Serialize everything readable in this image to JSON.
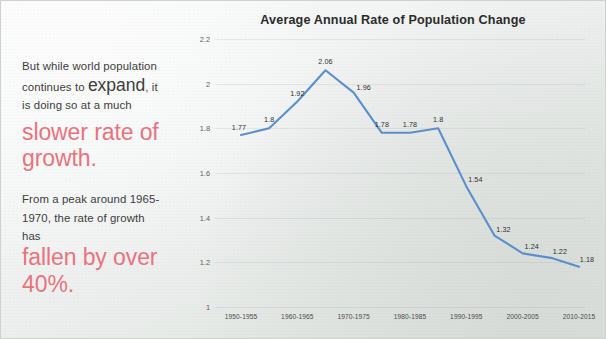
{
  "slide": {
    "background_color": "#eef1ef",
    "accent_pink": "#e8737f",
    "line_color": "#5b8fc9"
  },
  "left_text": {
    "paragraph1": {
      "line1": "But while world population",
      "line2_prefix": "continues to ",
      "line2_emphasis": "expand",
      "line2_suffix": ", it",
      "line3": "is doing so at a much"
    },
    "pink1": {
      "line1": "slower rate of",
      "line2": "growth."
    },
    "paragraph2": {
      "line1": "From a peak around 1965-",
      "line2": "1970, the rate of growth",
      "line3": "has"
    },
    "pink2": {
      "line1": "fallen by over",
      "line2": "40%."
    }
  },
  "chart_data": {
    "type": "line",
    "title": "Average Annual Rate of Population Change",
    "xlabel": "",
    "ylabel": "",
    "ylim": [
      1,
      2.2
    ],
    "yticks": [
      "1",
      "1.2",
      "1.4",
      "1.6",
      "1.8",
      "2",
      "2.2"
    ],
    "ytick_values": [
      1,
      1.2,
      1.4,
      1.6,
      1.8,
      2,
      2.2
    ],
    "grid": true,
    "legend": "none",
    "categories": [
      "1950-1955",
      "1955-1960",
      "1960-1965",
      "1965-1970",
      "1970-1975",
      "1975-1980",
      "1980-1985",
      "1985-1990",
      "1990-1995",
      "1995-2000",
      "2000-2005",
      "2005-2010",
      "2010-2015"
    ],
    "xtick_labels": [
      "1950-1955",
      "1960-1965",
      "1970-1975",
      "1980-1985",
      "1990-1995",
      "2000-2005",
      "2010-2015"
    ],
    "xtick_indices": [
      0,
      2,
      4,
      6,
      8,
      10,
      12
    ],
    "values": [
      1.77,
      1.8,
      1.92,
      2.06,
      1.96,
      1.78,
      1.78,
      1.8,
      1.54,
      1.32,
      1.24,
      1.22,
      1.18
    ],
    "data_labels": [
      "1.77",
      "1.8",
      "1.92",
      "2.06",
      "1.96",
      "1.78",
      "1.78",
      "1.8",
      "1.54",
      "1.32",
      "1.24",
      "1.22",
      "1.18"
    ],
    "series": [
      {
        "name": "Average annual rate of population change",
        "values": [
          1.77,
          1.8,
          1.92,
          2.06,
          1.96,
          1.78,
          1.78,
          1.8,
          1.54,
          1.32,
          1.24,
          1.22,
          1.18
        ]
      }
    ]
  }
}
